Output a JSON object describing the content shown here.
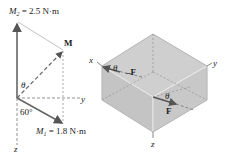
{
  "left_diagram": {
    "m2_label": "M",
    "m2_sub": "2",
    "m2_value": " = 2.5 N·m",
    "m_label": "M",
    "m1_label": "M",
    "m1_sub": "1",
    "m1_value": " = 1.8 N·m",
    "theta_label": "θ",
    "angle_label": "60°",
    "y_axis_label": "y",
    "z_axis_label": "z"
  },
  "right_diagram": {
    "x_axis_label": "x",
    "y_axis_label": "y",
    "z_axis_label": "z",
    "theta_top_label": "θ",
    "neg_force_label": "–F",
    "theta_front_label": "θ",
    "force_label": "F"
  },
  "colors": {
    "box_fill": "#c9c9c9",
    "box_edge": "#f2f2f2",
    "arrow": "#666666",
    "dashed": "#777777"
  }
}
